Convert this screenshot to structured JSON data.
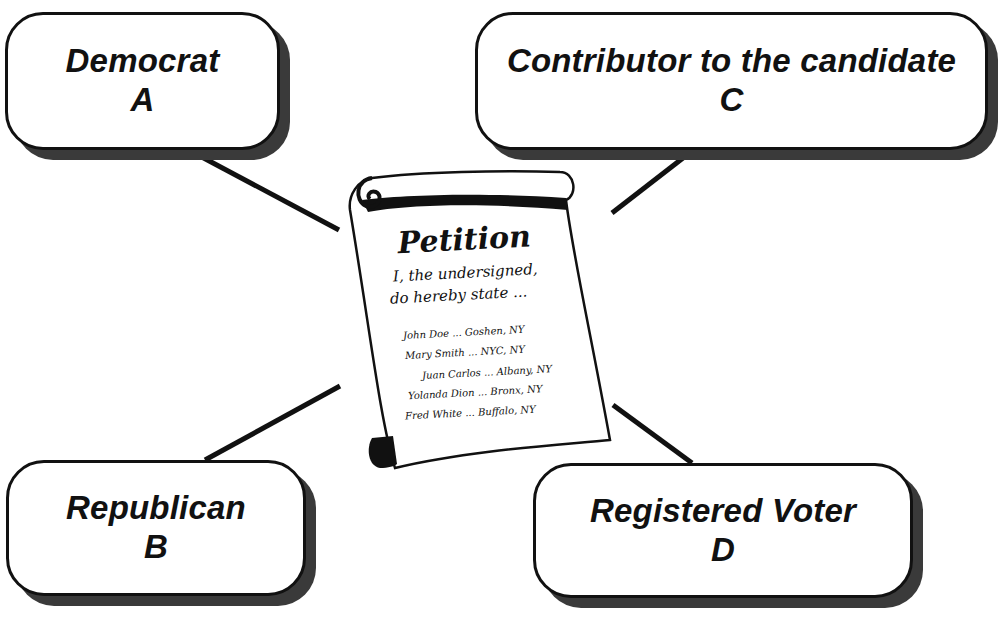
{
  "diagram": {
    "center": {
      "title": "Petition",
      "intro_lines": [
        "I, the undersigned,",
        "do hereby state ..."
      ],
      "signatures": [
        "John Doe ... Goshen, NY",
        "Mary Smith ... NYC, NY",
        "Juan Carlos ... Albany, NY",
        "Yolanda Dion ... Bronx, NY",
        "Fred White ... Buffalo, NY"
      ]
    },
    "options": [
      {
        "label": "Democrat",
        "letter": "A"
      },
      {
        "label": "Republican",
        "letter": "B"
      },
      {
        "label": "Contributor to the candidate",
        "letter": "C"
      },
      {
        "label": "Registered Voter",
        "letter": "D"
      }
    ],
    "colors": {
      "ink": "#111111",
      "shadow": "#3a3a3a",
      "background": "#ffffff"
    }
  }
}
